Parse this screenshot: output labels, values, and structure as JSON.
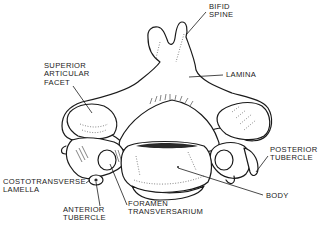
{
  "figure": {
    "style": "black-and-white anatomical line drawing",
    "colors": {
      "ink": "#1a1a1a",
      "background": "#ffffff"
    }
  },
  "labels": {
    "bifid_spine": {
      "line1": "BIFID",
      "line2": "SPINE"
    },
    "lamina": {
      "line1": "LAMINA"
    },
    "superior_articular_facet": {
      "line1": "SUPERIOR",
      "line2": "ARTICULAR",
      "line3": "FACET"
    },
    "posterior_tubercle": {
      "line1": "POSTERIOR",
      "line2": "TUBERCLE"
    },
    "costotransverse_lamella": {
      "line1": "COSTOTRANSVERSE",
      "line2": "LAMELLA"
    },
    "anterior_tubercle": {
      "line1": "ANTERIOR",
      "line2": "TUBERCLE"
    },
    "foramen_transversarium": {
      "line1": "FORAMEN",
      "line2": "TRANSVERSARIUM"
    },
    "body": {
      "line1": "BODY"
    }
  }
}
